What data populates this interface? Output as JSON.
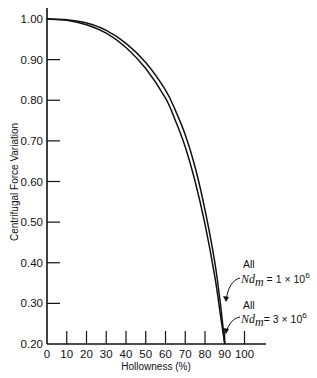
{
  "chart_data": {
    "type": "line",
    "title": "",
    "xlabel": "Hollowness (%)",
    "ylabel": "Centrifugal Force Variation",
    "xlim": [
      0,
      110
    ],
    "ylim": [
      0.2,
      1.0
    ],
    "x_ticks": [
      0,
      10,
      20,
      30,
      40,
      50,
      60,
      70,
      80,
      90,
      100
    ],
    "x_tick_labels": [
      "0",
      "10",
      "20",
      "30",
      "40",
      "50",
      "60",
      "70",
      "80",
      "90",
      "100"
    ],
    "y_ticks": [
      1.0,
      0.9,
      0.8,
      0.7,
      0.6,
      0.5,
      0.4,
      0.3,
      0.2
    ],
    "y_tick_labels": [
      "1.00",
      "0.90",
      "0.80",
      "0.70",
      "0.60",
      "0.50",
      "0.40",
      "0.30",
      "0.20"
    ],
    "grid": false,
    "legend": "none",
    "series": [
      {
        "name": "All Nd_m = 1 × 10^6",
        "x": [
          0,
          10,
          20,
          30,
          40,
          50,
          60,
          65,
          70,
          75,
          80,
          85,
          88,
          90
        ],
        "y": [
          1.0,
          0.998,
          0.99,
          0.972,
          0.94,
          0.893,
          0.825,
          0.775,
          0.715,
          0.635,
          0.53,
          0.4,
          0.29,
          0.2
        ]
      },
      {
        "name": "All Nd_m = 3 × 10^6",
        "x": [
          0,
          10,
          20,
          30,
          40,
          50,
          60,
          65,
          70,
          75,
          80,
          85,
          88,
          90
        ],
        "y": [
          1.0,
          0.997,
          0.986,
          0.965,
          0.93,
          0.878,
          0.805,
          0.75,
          0.685,
          0.6,
          0.495,
          0.365,
          0.265,
          0.2
        ]
      }
    ],
    "annotations": [
      {
        "line1": "All",
        "prefix": "Nd",
        "sub": "m",
        "text": " = 1 × 10",
        "sup": "6",
        "points_to": "Nd_m = 1 × 10^6 curve"
      },
      {
        "line1": "All",
        "prefix": "Nd",
        "sub": "m",
        "text": "= 3 × 10",
        "sup": "6",
        "points_to": "Nd_m = 3 × 10^6 curve"
      }
    ]
  }
}
